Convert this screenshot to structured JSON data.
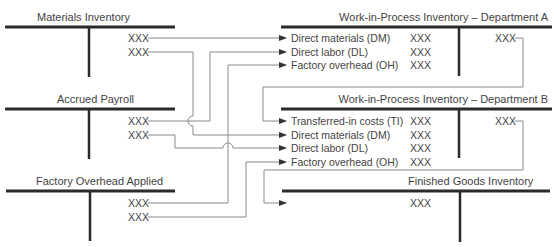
{
  "accounts": {
    "materials_inventory": {
      "title": "Materials Inventory",
      "credits": [
        "XXX",
        "XXX"
      ]
    },
    "accrued_payroll": {
      "title": "Accrued Payroll",
      "credits": [
        "XXX",
        "XXX"
      ]
    },
    "factory_overhead_applied": {
      "title": "Factory Overhead Applied",
      "credits": [
        "XXX",
        "XXX"
      ]
    },
    "wip_a": {
      "title": "Work-in-Process Inventory – Department A",
      "debits": [
        {
          "label": "Direct materials (DM)",
          "value": "XXX"
        },
        {
          "label": "Direct labor (DL)",
          "value": "XXX"
        },
        {
          "label": "Factory overhead (OH)",
          "value": "XXX"
        }
      ],
      "credit": "XXX"
    },
    "wip_b": {
      "title": "Work-in-Process Inventory – Department B",
      "debits": [
        {
          "label": "Transferred-in costs (TI)",
          "value": "XXX"
        },
        {
          "label": "Direct materials (DM)",
          "value": "XXX"
        },
        {
          "label": "Direct labor (DL)",
          "value": "XXX"
        },
        {
          "label": "Factory overhead (OH)",
          "value": "XXX"
        }
      ],
      "credit": "XXX"
    },
    "finished_goods": {
      "title": "Finished Goods Inventory",
      "debit": "XXX"
    }
  },
  "colors": {
    "bar": "#2a2a2a",
    "connector": "#8a8a8a",
    "text": "#444444"
  }
}
